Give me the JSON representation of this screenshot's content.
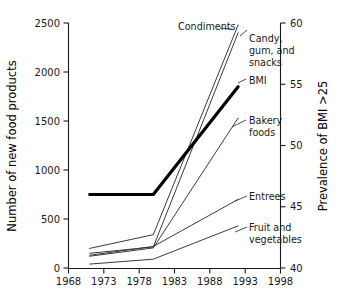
{
  "chart_data": {
    "type": "line",
    "title": "",
    "xlabel": "",
    "ylabel": "Number of new food products",
    "y2label": "Prevalence of BMI >25",
    "xlim": [
      1968,
      1998
    ],
    "ylim": [
      0,
      2500
    ],
    "y2lim": [
      40,
      60
    ],
    "grid": false,
    "legend_position": "inline-end-labels",
    "x_ticks": [
      "1968",
      "1973",
      "1978",
      "1983",
      "1988",
      "1993",
      "1998"
    ],
    "x_tick_values": [
      1968,
      1973,
      1978,
      1983,
      1988,
      1993,
      1998
    ],
    "y_ticks": [
      "0",
      "500",
      "1000",
      "1500",
      "2000",
      "2500"
    ],
    "y_tick_values": [
      0,
      500,
      1000,
      1500,
      2000,
      2500
    ],
    "y2_ticks": [
      "40",
      "45",
      "50",
      "55",
      "60"
    ],
    "y2_tick_values": [
      40,
      45,
      50,
      55,
      60
    ],
    "series": [
      {
        "name": "Condiments",
        "axis": "left",
        "emphasis": false,
        "x": [
          1971,
          1980,
          1992
        ],
        "values": [
          200,
          340,
          2480
        ]
      },
      {
        "name": "Candy, gum, and snacks",
        "axis": "left",
        "emphasis": false,
        "x": [
          1971,
          1980,
          1992
        ],
        "values": [
          150,
          215,
          2400
        ]
      },
      {
        "name": "BMI",
        "axis": "right",
        "emphasis": true,
        "x": [
          1971,
          1980,
          1992
        ],
        "values": [
          46.0,
          46.0,
          54.8
        ]
      },
      {
        "name": "Bakery foods",
        "axis": "left",
        "emphasis": false,
        "x": [
          1971,
          1980,
          1992
        ],
        "values": [
          120,
          205,
          1530
        ]
      },
      {
        "name": "Entrees",
        "axis": "left",
        "emphasis": false,
        "x": [
          1971,
          1980,
          1992
        ],
        "values": [
          130,
          220,
          700
        ]
      },
      {
        "name": "Fruit and vegetables",
        "axis": "left",
        "emphasis": false,
        "x": [
          1971,
          1980,
          1992
        ],
        "values": [
          40,
          90,
          430
        ]
      }
    ],
    "annotations": [
      {
        "text": "Condiments",
        "x": 1988,
        "y": 2400
      },
      {
        "text": "Candy,",
        "x": 1993,
        "y": 2230
      },
      {
        "text": "gum, and",
        "x": 1993,
        "y": 2110
      },
      {
        "text": "snacks",
        "x": 1993,
        "y": 1990
      },
      {
        "text": "BMI",
        "x": 1993,
        "y": 1790
      },
      {
        "text": "Bakery",
        "x": 1993,
        "y": 1420
      },
      {
        "text": "foods",
        "x": 1993,
        "y": 1300
      },
      {
        "text": "Entrees",
        "x": 1993,
        "y": 740
      },
      {
        "text": "Fruit and",
        "x": 1993,
        "y": 370
      },
      {
        "text": "vegetables",
        "x": 1993,
        "y": 250
      }
    ]
  },
  "axes": {
    "left_title": "Number of new food products",
    "right_title": "Prevalence of BMI >25",
    "x_labels": {
      "t0": "1968",
      "t1": "1973",
      "t2": "1978",
      "t3": "1983",
      "t4": "1988",
      "t5": "1993",
      "t6": "1998"
    },
    "y_labels": {
      "t0": "0",
      "t1": "500",
      "t2": "1000",
      "t3": "1500",
      "t4": "2000",
      "t5": "2500"
    },
    "y2_labels": {
      "t0": "40",
      "t1": "45",
      "t2": "50",
      "t3": "55",
      "t4": "60"
    }
  },
  "series_labels": {
    "condiments": "Condiments",
    "candy_1": "Candy,",
    "candy_2": "gum, and",
    "candy_3": "snacks",
    "bmi": "BMI",
    "bakery_1": "Bakery",
    "bakery_2": "foods",
    "entrees": "Entrees",
    "fruit_1": "Fruit and",
    "fruit_2": "vegetables"
  },
  "colors": {
    "line": "#3a3a3a",
    "emphasis_line": "#000000",
    "axis": "#1a1a1a",
    "text": "#1a1a1a",
    "background": "#ffffff"
  }
}
